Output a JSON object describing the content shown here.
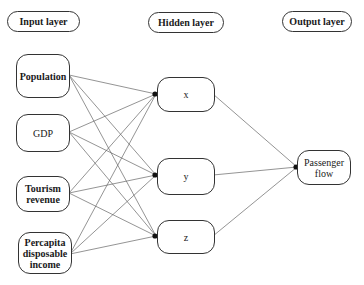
{
  "diagram": {
    "type": "neural-network",
    "headers": {
      "input": "Input layer",
      "hidden": "Hidden layer",
      "output": "Output layer"
    },
    "input_nodes": [
      {
        "id": "population",
        "label": "Population"
      },
      {
        "id": "gdp",
        "label": "GDP"
      },
      {
        "id": "tourism",
        "label": "Tourism revenue"
      },
      {
        "id": "percapita",
        "label": "Percapita disposable income"
      }
    ],
    "hidden_nodes": [
      {
        "id": "x",
        "label": "x"
      },
      {
        "id": "y",
        "label": "y"
      },
      {
        "id": "z",
        "label": "z"
      }
    ],
    "output_nodes": [
      {
        "id": "passenger",
        "label": "Passenger flow"
      }
    ],
    "connections": "fully-connected input→hidden, hidden→output",
    "colors": {
      "line": "#555555",
      "border": "#333333",
      "arrowhead": "#111111"
    }
  }
}
